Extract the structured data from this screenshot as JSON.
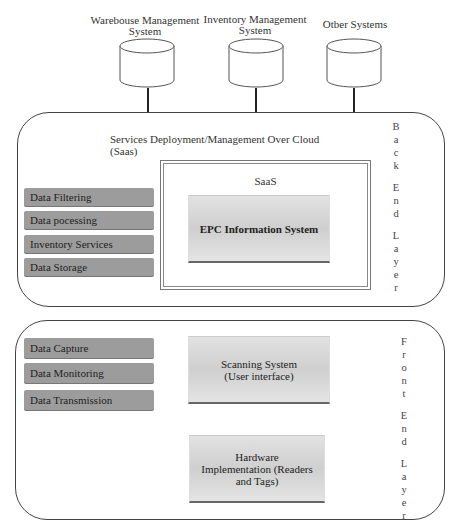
{
  "external_systems": [
    {
      "label_line1": "Warebouse Management",
      "label_line2": "System"
    },
    {
      "label_line1": "Inventory Management",
      "label_line2": "System"
    },
    {
      "label_line1": "Otber Systems",
      "label_line2": ""
    }
  ],
  "back_end_layer": {
    "title_line1": "Services Deployment/Management Over Cloud",
    "title_line2": "(Saas)",
    "side_label": [
      "B",
      "a",
      "c",
      "k",
      "",
      "E",
      "n",
      "d",
      "",
      "L",
      "a",
      "y",
      "e",
      "r"
    ],
    "services": [
      "Data Filtering",
      "Data pocessing",
      "Inventory Services",
      "Data Storage"
    ],
    "saas_box": {
      "title": "SaaS",
      "inner": "EPC Information System"
    }
  },
  "front_end_layer": {
    "side_label": [
      "F",
      "r",
      "o",
      "n",
      "t",
      "",
      "E",
      "n",
      "d",
      "",
      "L",
      "a",
      "y",
      "e",
      "r"
    ],
    "functions": [
      "Data Capture",
      "Data Monitoring",
      "Data Transmission"
    ],
    "scanning_system": {
      "line1": "Scanning System",
      "line2": "(User interface)"
    },
    "hardware": {
      "line1": "Hardware",
      "line2": "Implementation (Readers",
      "line3": "and Tags)"
    }
  },
  "colors": {
    "item_fill": "#9c9c9c",
    "gradient_box": "#d6d6d6",
    "border": "#444444"
  }
}
